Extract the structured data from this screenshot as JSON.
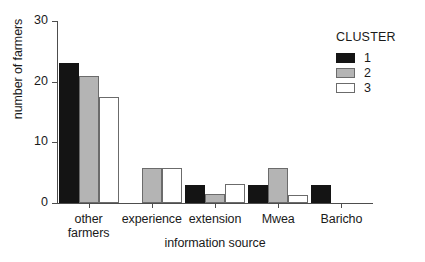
{
  "chart_data": {
    "type": "bar",
    "title": "",
    "xlabel": "information source",
    "ylabel": "number of farmers",
    "categories": [
      "other farmers",
      "experience",
      "extension",
      "Mwea",
      "Baricho"
    ],
    "category_lines": [
      [
        "other",
        "farmers"
      ],
      [
        "experience"
      ],
      [
        "extension"
      ],
      [
        "Mwea"
      ],
      [
        "Baricho"
      ]
    ],
    "series": [
      {
        "name": "1",
        "color": "#141414",
        "values": [
          23,
          0,
          3,
          3,
          3
        ]
      },
      {
        "name": "2",
        "color": "#b4b4b4",
        "values": [
          21,
          5.7,
          1.5,
          5.7,
          0
        ]
      },
      {
        "name": "3",
        "color": "#ffffff",
        "values": [
          17.5,
          5.7,
          3.2,
          1.3,
          0
        ]
      }
    ],
    "ylim": [
      0,
      30
    ],
    "yticks": [
      0,
      10,
      20,
      30
    ],
    "ytick_labels": [
      "0",
      "10",
      "20",
      "30"
    ],
    "grid": false,
    "legend": {
      "title": "CLUSTER",
      "position": "top-right",
      "entries": [
        {
          "label": "1",
          "color": "#141414"
        },
        {
          "label": "2",
          "color": "#b4b4b4"
        },
        {
          "label": "3",
          "color": "#ffffff"
        }
      ]
    }
  }
}
